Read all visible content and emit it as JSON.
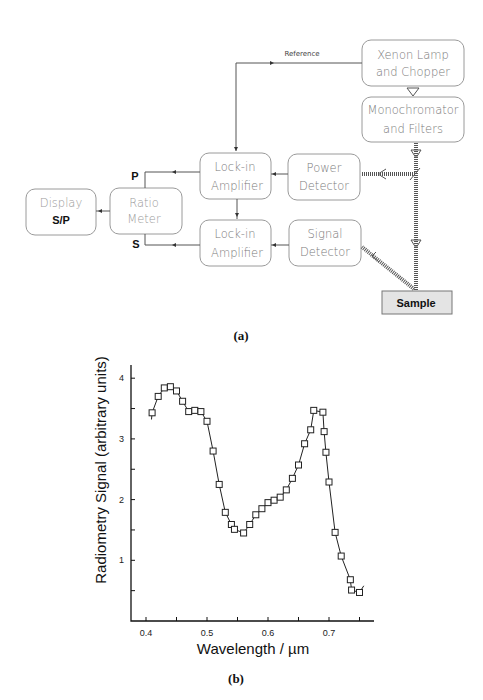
{
  "diagram": {
    "caption": "(a)",
    "reference_label": "Reference",
    "boxes": {
      "xenon": [
        "Xenon Lamp",
        "and Chopper"
      ],
      "mono": [
        "Monochromator",
        "and Filters"
      ],
      "power": [
        "Power",
        "Detector"
      ],
      "signal": [
        "Signal",
        "Detector"
      ],
      "lockin_top": [
        "Lock-in",
        "Amplifier"
      ],
      "lockin_bottom": [
        "Lock-in",
        "Amplifier"
      ],
      "ratio": [
        "Ratio",
        "Meter"
      ],
      "display": [
        "Display",
        "S/P"
      ],
      "sample": "Sample"
    },
    "port_labels": {
      "p": "P",
      "s": "S"
    }
  },
  "chart_data": {
    "type": "line",
    "caption": "(b)",
    "title": "",
    "xlabel": "Wavelength / µm",
    "ylabel": "Radiometry Signal (arbitrary units)",
    "xlim": [
      0.38,
      0.78
    ],
    "ylim": [
      0,
      4.3
    ],
    "x_ticks": [
      0.4,
      0.45,
      0.5,
      0.55,
      0.6,
      0.65,
      0.7,
      0.75
    ],
    "x_tick_labels": [
      "0.4",
      "",
      "0.5",
      "",
      "0.6",
      "",
      "0.7",
      ""
    ],
    "y_ticks": [
      0.5,
      1,
      1.5,
      2,
      2.5,
      3,
      3.5,
      4
    ],
    "y_tick_labels": [
      "",
      "1",
      "",
      "2",
      "",
      "3",
      "",
      "4"
    ],
    "grid": false,
    "marker": "open-square",
    "series": [
      {
        "name": "Radiometry Signal",
        "x": [
          0.41,
          0.42,
          0.43,
          0.44,
          0.45,
          0.46,
          0.47,
          0.48,
          0.49,
          0.5,
          0.51,
          0.52,
          0.53,
          0.54,
          0.545,
          0.56,
          0.57,
          0.58,
          0.59,
          0.6,
          0.61,
          0.62,
          0.63,
          0.64,
          0.65,
          0.66,
          0.67,
          0.675,
          0.69,
          0.692,
          0.695,
          0.7,
          0.71,
          0.72,
          0.735,
          0.737,
          0.75
        ],
        "y": [
          3.43,
          3.7,
          3.84,
          3.86,
          3.79,
          3.62,
          3.45,
          3.47,
          3.45,
          3.29,
          2.8,
          2.25,
          1.79,
          1.59,
          1.51,
          1.45,
          1.59,
          1.75,
          1.85,
          1.95,
          1.99,
          2.04,
          2.16,
          2.35,
          2.57,
          2.92,
          3.15,
          3.47,
          3.44,
          3.12,
          2.78,
          2.29,
          1.46,
          1.07,
          0.68,
          0.51,
          0.47
        ]
      }
    ]
  }
}
